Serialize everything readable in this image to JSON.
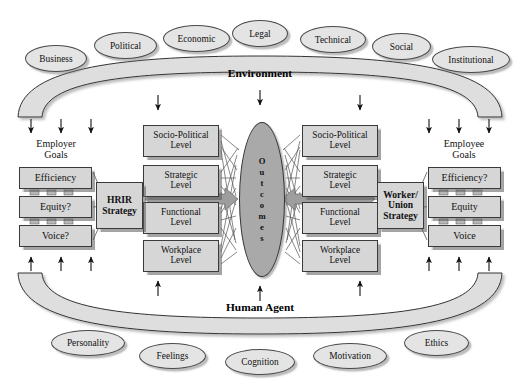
{
  "diagram": {
    "bands": {
      "top": {
        "label": "Environment"
      },
      "bottom": {
        "label": "Human Agent"
      }
    },
    "environment_factors": [
      {
        "label": "Business",
        "x": 25,
        "y": 45,
        "w": 62,
        "h": 27
      },
      {
        "label": "Political",
        "x": 94,
        "y": 32,
        "w": 63,
        "h": 27
      },
      {
        "label": "Economic",
        "x": 163,
        "y": 25,
        "w": 67,
        "h": 27
      },
      {
        "label": "Legal",
        "x": 232,
        "y": 20,
        "w": 56,
        "h": 27
      },
      {
        "label": "Technical",
        "x": 300,
        "y": 26,
        "w": 66,
        "h": 27
      },
      {
        "label": "Social",
        "x": 372,
        "y": 33,
        "w": 59,
        "h": 27
      },
      {
        "label": "Institutional",
        "x": 432,
        "y": 46,
        "w": 78,
        "h": 27
      }
    ],
    "human_agent_factors": [
      {
        "label": "Personality",
        "x": 51,
        "y": 330,
        "w": 74,
        "h": 26
      },
      {
        "label": "Feelings",
        "x": 139,
        "y": 343,
        "w": 67,
        "h": 26
      },
      {
        "label": "Cognition",
        "x": 225,
        "y": 349,
        "w": 70,
        "h": 26
      },
      {
        "label": "Motivation",
        "x": 313,
        "y": 343,
        "w": 74,
        "h": 26
      },
      {
        "label": "Ethics",
        "x": 404,
        "y": 330,
        "w": 65,
        "h": 26
      }
    ],
    "employer": {
      "caption": "Employer\nGoals",
      "goals": [
        {
          "label": "Efficiency",
          "x": 19,
          "y": 167,
          "w": 73,
          "h": 22
        },
        {
          "label": "Equity?",
          "x": 19,
          "y": 196,
          "w": 73,
          "h": 22
        },
        {
          "label": "Voice?",
          "x": 19,
          "y": 225,
          "w": 73,
          "h": 22
        }
      ],
      "strategy": {
        "label": "HRIR\nStrategy",
        "x": 96,
        "y": 182,
        "w": 47,
        "h": 47
      }
    },
    "employee": {
      "caption": "Employee\nGoals",
      "goals": [
        {
          "label": "Efficiency?",
          "x": 428,
          "y": 167,
          "w": 73,
          "h": 22
        },
        {
          "label": "Equity",
          "x": 428,
          "y": 196,
          "w": 73,
          "h": 22
        },
        {
          "label": "Voice",
          "x": 428,
          "y": 225,
          "w": 73,
          "h": 22
        }
      ],
      "strategy": {
        "label": "Worker/\nUnion\nStrategy",
        "x": 377,
        "y": 182,
        "w": 47,
        "h": 47
      }
    },
    "left_levels": [
      {
        "label": "Socio-Political\nLevel",
        "x": 143,
        "y": 125,
        "w": 76,
        "h": 32
      },
      {
        "label": "Strategic\nLevel",
        "x": 143,
        "y": 165,
        "w": 76,
        "h": 32
      },
      {
        "label": "Functional\nLevel",
        "x": 143,
        "y": 202,
        "w": 76,
        "h": 32
      },
      {
        "label": "Workplace\nLevel",
        "x": 143,
        "y": 240,
        "w": 76,
        "h": 32
      }
    ],
    "right_levels": [
      {
        "label": "Socio-Political\nLevel",
        "x": 302,
        "y": 125,
        "w": 76,
        "h": 32
      },
      {
        "label": "Strategic\nLevel",
        "x": 302,
        "y": 165,
        "w": 76,
        "h": 32
      },
      {
        "label": "Functional\nLevel",
        "x": 302,
        "y": 202,
        "w": 76,
        "h": 32
      },
      {
        "label": "Workplace\nLevel",
        "x": 302,
        "y": 240,
        "w": 76,
        "h": 32
      }
    ],
    "outcomes": {
      "label": "Outcomes",
      "letters": [
        "O",
        "u",
        "t",
        "c",
        "o",
        "m",
        "e",
        "s"
      ]
    },
    "colors": {
      "box_fill": "#d6d6d6",
      "band_fill": "#dedede",
      "outcomes_fill": "#a9a9a9",
      "arrow_fill": "#9e9e9e",
      "stroke": "#3a3a3a",
      "ellipse_fill": "#e4e4e4"
    }
  }
}
